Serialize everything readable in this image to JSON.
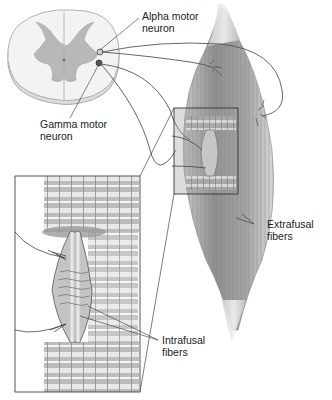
{
  "diagram": {
    "type": "anatomical-illustration",
    "labels": {
      "alpha_motor_neuron": {
        "line1": "Alpha motor",
        "line2": "neuron"
      },
      "gamma_motor_neuron": {
        "line1": "Gamma motor",
        "line2": "neuron"
      },
      "extrafusal_fibers": {
        "line1": "Extrafusal",
        "line2": "fibers"
      },
      "intrafusal_fibers": {
        "line1": "Intrafusal",
        "line2": "fibers"
      }
    },
    "components": [
      "spinal-cord-cross-section",
      "skeletal-muscle",
      "muscle-spindle",
      "magnified-inset"
    ],
    "colors": {
      "gray_matter": "#b8b8b8",
      "white_matter": "#f0f0f0",
      "muscle": "#9a9a9a",
      "nerve": "#555555",
      "outline": "#444444"
    }
  }
}
